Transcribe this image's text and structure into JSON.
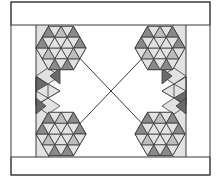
{
  "diagram": {
    "title": "",
    "type": "quilt-pattern",
    "colors": {
      "background": "#ffffff",
      "line": "#3a3a3a",
      "light": "#e2e2e2",
      "mid": "#bdbdbd",
      "dark": "#8a8a8a",
      "darker": "#6a6a6a"
    },
    "frame": {
      "x": 11,
      "y": 2,
      "w": 199,
      "h": 173
    },
    "top_band": {
      "y1": 2,
      "y2": 25
    },
    "bottom_band": {
      "y1": 157,
      "y2": 175
    },
    "side_strips": [
      {
        "name": "left",
        "x": 36,
        "w": 12
      },
      {
        "name": "right",
        "x": 174,
        "w": 12
      }
    ],
    "star_blocks": [
      {
        "name": "top-left",
        "cx": 61,
        "cy": 48,
        "r": 25
      },
      {
        "name": "top-right",
        "cx": 160,
        "cy": 48,
        "r": 25
      },
      {
        "name": "bottom-left",
        "cx": 61,
        "cy": 134,
        "r": 25
      },
      {
        "name": "bottom-right",
        "cx": 160,
        "cy": 134,
        "r": 25
      }
    ]
  }
}
